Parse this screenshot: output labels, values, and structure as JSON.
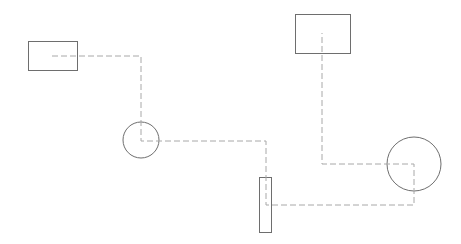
{
  "canvas": {
    "width": 461,
    "height": 244,
    "background": "#ffffff"
  },
  "colors": {
    "shape_stroke": "#6e6e6e",
    "connector_stroke": "#a8a8a8"
  },
  "shapes": [
    {
      "id": "rect-1",
      "type": "rect",
      "x": 28,
      "y": 41,
      "w": 49,
      "h": 29
    },
    {
      "id": "circle-1",
      "type": "circle",
      "cx": 141,
      "cy": 140,
      "r": 18
    },
    {
      "id": "rect-tall",
      "type": "rect",
      "x": 259,
      "y": 177,
      "w": 12,
      "h": 55
    },
    {
      "id": "rect-2",
      "type": "rect",
      "x": 295,
      "y": 14,
      "w": 55,
      "h": 39
    },
    {
      "id": "circle-2",
      "type": "circle",
      "cx": 414,
      "cy": 164,
      "r": 27
    }
  ],
  "connectors": [
    {
      "id": "path-1",
      "points": "52,56 141,56 141,141 266,141 266,205 414,205 414,164 322,164 322,33"
    }
  ]
}
